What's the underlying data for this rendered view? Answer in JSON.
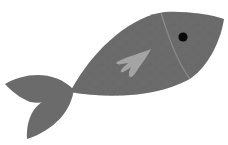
{
  "image": {
    "subject": "fish illustration",
    "description": "Flat gray cartoon fish swimming toward upper right with scale pattern, gill line, black eye and light gray pectoral fin"
  },
  "colors": {
    "background": "#ffffff",
    "body": "#6b6b6b",
    "scale_pattern": "#636363",
    "gill_line": "#8a8a8a",
    "fin": "#a4a4a4",
    "eye": "#0a0a0a"
  }
}
